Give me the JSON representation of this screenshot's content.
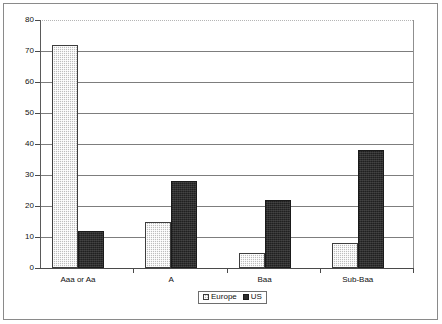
{
  "chart_data": {
    "type": "bar",
    "title": "",
    "subtitle": "",
    "xlabel": "",
    "ylabel": "",
    "categories": [
      "Aaa or Aa",
      "A",
      "Baa",
      "Sub-Baa"
    ],
    "series": [
      {
        "name": "Europe",
        "values": [
          72,
          15,
          5,
          8
        ],
        "color": "#bdbdbd",
        "pattern": "light-dotted"
      },
      {
        "name": "US",
        "values": [
          12,
          28,
          22,
          38
        ],
        "color": "#2e2e2e",
        "pattern": "solid-dark"
      }
    ],
    "ylim": [
      0,
      80
    ],
    "ytick_labels": [
      "0",
      "10",
      "20",
      "30",
      "40",
      "50",
      "60",
      "70",
      "80"
    ],
    "ytick_values": [
      0,
      10,
      20,
      30,
      40,
      50,
      60,
      70,
      80
    ],
    "grid": true,
    "grid_orientation": "horizontal",
    "legend_position": "bottom-center",
    "legend_entries": [
      "Europe",
      "US"
    ],
    "frame": true
  },
  "colors": {
    "europe_fill": "#bdbdbd",
    "us_fill": "#2e2e2e",
    "gridline": "#7d7d7d",
    "axis": "#4a4a4a",
    "frame_border": "#8a8a8a",
    "text": "#111111",
    "background": "#ffffff"
  }
}
